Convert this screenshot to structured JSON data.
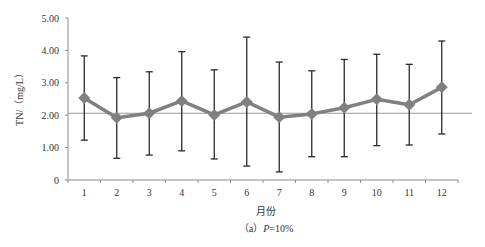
{
  "chart_data": {
    "type": "line",
    "title": "",
    "xlabel": "月份",
    "ylabel": "TN/（mg/L）",
    "caption_prefix": "（a）",
    "caption_var": "P",
    "caption_suffix": "=10%",
    "categories": [
      "1",
      "2",
      "3",
      "4",
      "5",
      "6",
      "7",
      "8",
      "9",
      "10",
      "11",
      "12"
    ],
    "series": [
      {
        "name": "TN mean",
        "values": [
          2.53,
          1.92,
          2.06,
          2.44,
          2.01,
          2.41,
          1.94,
          2.04,
          2.23,
          2.49,
          2.32,
          2.86
        ],
        "upper": [
          3.83,
          3.16,
          3.34,
          3.96,
          3.4,
          4.41,
          3.64,
          3.37,
          3.72,
          3.88,
          3.57,
          4.29
        ],
        "lower": [
          1.23,
          0.67,
          0.77,
          0.9,
          0.65,
          0.43,
          0.25,
          0.72,
          0.72,
          1.06,
          1.08,
          1.42
        ],
        "color": "#808080",
        "marker": "diamond"
      }
    ],
    "reference_line": {
      "value": 2.06,
      "color": "#9a9a9a"
    },
    "yticks": [
      "0",
      "1.00",
      "2.00",
      "3.00",
      "4.00",
      "5.00"
    ],
    "ylim": [
      0,
      5
    ],
    "grid": false,
    "legend": "none"
  }
}
